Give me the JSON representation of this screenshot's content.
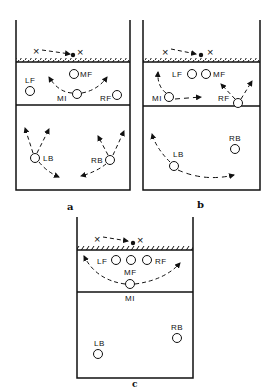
{
  "figure": {
    "panels": [
      {
        "caption": "a",
        "players": {
          "LF": "LF",
          "MF": "MF",
          "MI": "MI",
          "RF": "RF",
          "LB": "LB",
          "RB": "RB"
        }
      },
      {
        "caption": "b",
        "players": {
          "LF": "LF",
          "MF": "MF",
          "MI": "MI",
          "RF": "RF",
          "LB": "LB",
          "RB": "RB"
        }
      },
      {
        "caption": "c",
        "players": {
          "LF": "LF",
          "MF": "MF",
          "MI": "MI",
          "RF": "RF",
          "LB": "LB",
          "RB": "RB"
        }
      }
    ],
    "symbols": {
      "opponent": "×",
      "ball": "●"
    },
    "colors": {
      "ink": "#111111",
      "background": "#ffffff"
    }
  }
}
